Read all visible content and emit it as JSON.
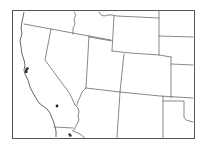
{
  "map": {
    "region": "Western United States",
    "style": "black-and-white outline locator map",
    "colors": {
      "background": "#ffffff",
      "lines": "#6a6a6a",
      "marker": "#222222"
    },
    "markers": [
      {
        "type": "dot",
        "location": "central-southern California",
        "x": 57,
        "y": 106
      }
    ],
    "features": [
      "San Francisco Bay mark",
      "Los Angeles area coastline mark"
    ]
  }
}
